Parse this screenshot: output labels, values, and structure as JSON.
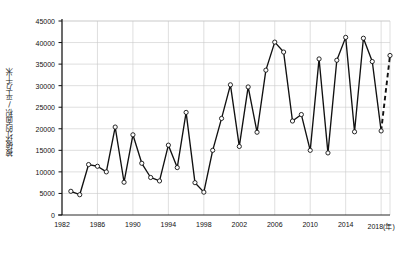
{
  "chart_data": {
    "type": "line",
    "title": "",
    "xlabel": "年",
    "ylabel": "被破坏的面积/平方千米",
    "xlim": [
      1982,
      2019
    ],
    "ylim": [
      0,
      45000
    ],
    "grid": true,
    "legend": "none",
    "x_tick_labels": [
      "1982",
      "1986",
      "1990",
      "1994",
      "1998",
      "2002",
      "2006",
      "2010",
      "2014",
      "2018(年)"
    ],
    "x_tick_values": [
      1982,
      1986,
      1990,
      1994,
      1998,
      2002,
      2006,
      2010,
      2014,
      2018
    ],
    "y_tick_labels": [
      "0",
      "5000",
      "10000",
      "15000",
      "20000",
      "25000",
      "30000",
      "35000",
      "40000",
      "45000"
    ],
    "y_tick_values": [
      0,
      5000,
      10000,
      15000,
      20000,
      25000,
      30000,
      35000,
      40000,
      45000
    ],
    "marker": "open-circle",
    "x": [
      1983,
      1984,
      1985,
      1986,
      1987,
      1988,
      1989,
      1990,
      1991,
      1992,
      1993,
      1994,
      1995,
      1996,
      1997,
      1998,
      1999,
      2000,
      2001,
      2002,
      2003,
      2004,
      2005,
      2006,
      2007,
      2008,
      2009,
      2010,
      2011,
      2012,
      2013,
      2014,
      2015,
      2016,
      2017,
      2018
    ],
    "values": [
      5500,
      4700,
      11700,
      11300,
      10000,
      20400,
      7600,
      18600,
      12000,
      8700,
      7900,
      16200,
      11000,
      23800,
      7500,
      5300,
      15000,
      22400,
      30200,
      15900,
      29700,
      19200,
      33600,
      40100,
      37800,
      21800,
      23300,
      15000,
      36200,
      14400,
      35900,
      41200,
      19300,
      41000,
      35600,
      19500
    ],
    "series": [
      {
        "name": "被破坏的面积",
        "style": "solid",
        "values": [
          5500,
          4700,
          11700,
          11300,
          10000,
          20400,
          7600,
          18600,
          12000,
          8700,
          7900,
          16200,
          11000,
          23800,
          7500,
          5300,
          15000,
          22400,
          30200,
          15900,
          29700,
          19200,
          33600,
          40100,
          37800,
          21800,
          23300,
          15000,
          36200,
          14400,
          35900,
          41200,
          19300,
          41000,
          35600,
          19500
        ]
      },
      {
        "name": "预测",
        "style": "dashed",
        "x": [
          2018,
          2019
        ],
        "values": [
          19500,
          37000
        ]
      }
    ],
    "annotations": [
      {
        "text": "最后一段为虚线（预测）",
        "visible": false
      }
    ],
    "colors": {
      "line": "#111111",
      "marker_fill": "#ffffff",
      "marker_stroke": "#111111",
      "grid": "#c9c9c9",
      "axis": "#111111",
      "background": "#ffffff"
    }
  }
}
